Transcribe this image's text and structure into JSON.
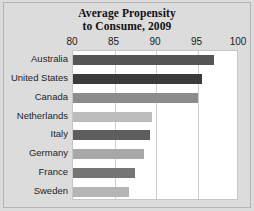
{
  "chart_data": {
    "type": "bar",
    "orientation": "horizontal",
    "title": "Average Propensity to Consume, 2009",
    "title_line1": "Average Propensity",
    "title_line2": "to Consume, 2009",
    "xlabel": "",
    "ylabel": "",
    "xlim": [
      80,
      100
    ],
    "xticks": [
      80,
      85,
      90,
      95,
      100
    ],
    "xtick_labels": [
      "80",
      "85",
      "90",
      "95",
      "100"
    ],
    "grid": true,
    "legend": false,
    "categories": [
      "Australia",
      "United States",
      "Canada",
      "Netherlands",
      "Italy",
      "Germany",
      "France",
      "Sweden"
    ],
    "values": [
      97.0,
      95.5,
      95.0,
      89.5,
      89.3,
      88.5,
      87.5,
      86.7
    ],
    "bar_colors": [
      "#555555",
      "#3b3b3b",
      "#8c8c8c",
      "#bcbcbc",
      "#5e5e5e",
      "#a8a8a8",
      "#757575",
      "#b5b5b5"
    ],
    "bars": [
      {
        "label": "Australia",
        "value": 97.0,
        "color": "#555555"
      },
      {
        "label": "United States",
        "value": 95.5,
        "color": "#3b3b3b"
      },
      {
        "label": "Canada",
        "value": 95.0,
        "color": "#8c8c8c"
      },
      {
        "label": "Netherlands",
        "value": 89.5,
        "color": "#bcbcbc"
      },
      {
        "label": "Italy",
        "value": 89.3,
        "color": "#5e5e5e"
      },
      {
        "label": "Germany",
        "value": 88.5,
        "color": "#a8a8a8"
      },
      {
        "label": "France",
        "value": 87.5,
        "color": "#757575"
      },
      {
        "label": "Sweden",
        "value": 86.7,
        "color": "#b5b5b5"
      }
    ]
  },
  "figure": {
    "background_color": "#dcdcdc",
    "plot_background_color": "#ffffff",
    "border_color": "#b4b4b4",
    "gridline_color": "#cfcfcf"
  }
}
